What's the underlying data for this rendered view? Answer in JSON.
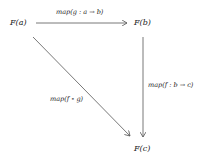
{
  "diagram": {
    "type": "commutative-diagram",
    "nodes": [
      {
        "id": "Fa",
        "label": "F(a)"
      },
      {
        "id": "Fb",
        "label": "F(b)"
      },
      {
        "id": "Fc",
        "label": "F(c)"
      }
    ],
    "edges": [
      {
        "from": "Fa",
        "to": "Fb",
        "label": "map(g : a → b)"
      },
      {
        "from": "Fb",
        "to": "Fc",
        "label": "map(f : b → c)"
      },
      {
        "from": "Fa",
        "to": "Fc",
        "label": "map(f ∘ g)"
      }
    ],
    "colors": {
      "line": "#555555",
      "text": "#222222",
      "background": "#ffffff"
    }
  }
}
